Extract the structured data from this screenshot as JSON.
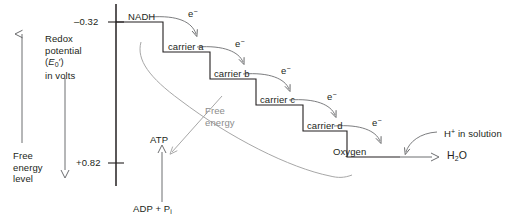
{
  "figure": {
    "type": "electron-transport-chain-energy-diagram",
    "axis": {
      "title_lines": [
        "Redox",
        "potential",
        "(E0')",
        "in volts"
      ],
      "title_symbol_plain": "E",
      "title_symbol_sub": "0",
      "title_symbol_prime": "′",
      "ticks": [
        {
          "label": "–0.32",
          "value": -0.32
        },
        {
          "label": "+0.82",
          "value": 0.82
        }
      ]
    },
    "free_energy_axis": {
      "label_lines": [
        "Free",
        "energy",
        "level"
      ],
      "up_arrow": "free-energy-up-arrow",
      "down_arrow": "redox-potential-down-arrow"
    },
    "steps": [
      {
        "label": "NADH",
        "redox": -0.32
      },
      {
        "label": "carrier a",
        "redox": -0.1
      },
      {
        "label": "carrier b",
        "redox": 0.1
      },
      {
        "label": "carrier c",
        "redox": 0.25
      },
      {
        "label": "carrier d",
        "redox": 0.45
      },
      {
        "label": "Oxygen",
        "redox": 0.82
      }
    ],
    "electron_labels": [
      "e−",
      "e−",
      "e−",
      "e−",
      "e−"
    ],
    "free_energy_curve_label": [
      "Free",
      "energy"
    ],
    "atp": {
      "product": "ATP",
      "reactant_plain": "ADP + P",
      "reactant_sub": "i"
    },
    "products": {
      "proton_plain": "H",
      "proton_sup": "+",
      "proton_rest": " in solution",
      "water_plain": "H",
      "water_sub": "2",
      "water_rest": "O"
    },
    "colors": {
      "ink": "#231f20",
      "gray": "#8c8c8c",
      "background": "#ffffff"
    }
  }
}
